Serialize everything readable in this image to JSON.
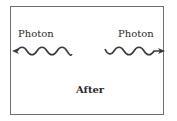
{
  "diagram": {
    "left_photon": {
      "label": "Photon",
      "direction": "left"
    },
    "right_photon": {
      "label": "Photon",
      "direction": "right"
    },
    "caption": "After",
    "colors": {
      "line": "#3a3a3a",
      "border": "#6e6e6e",
      "text": "#2a2a2a"
    }
  }
}
